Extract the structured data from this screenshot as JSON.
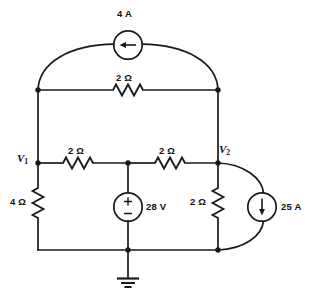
{
  "diagram": {
    "type": "electrical-schematic",
    "stroke_color": "#1a1a1a",
    "background_color": "#ffffff"
  },
  "labels": {
    "source_top": "4 A",
    "resistor_top": "2 Ω",
    "resistor_mid_left": "2 Ω",
    "resistor_mid_right": "2 Ω",
    "resistor_left_vertical": "4 Ω",
    "resistor_right_vertical": "2 Ω",
    "source_voltage": "28 V",
    "source_right": "25 A",
    "node_v1": "V",
    "node_v1_sub": "1",
    "node_v2": "V",
    "node_v2_sub": "2"
  },
  "components": [
    {
      "name": "current-source-4a",
      "kind": "current-source",
      "value": "4 A",
      "arrow_direction": "left",
      "cx": 128,
      "cy": 45
    },
    {
      "name": "resistor-top-2ohm",
      "kind": "resistor",
      "value": "2 Ω",
      "orientation": "horizontal"
    },
    {
      "name": "resistor-left-branch-2ohm",
      "kind": "resistor",
      "value": "2 Ω",
      "orientation": "horizontal"
    },
    {
      "name": "resistor-right-branch-2ohm",
      "kind": "resistor",
      "value": "2 Ω",
      "orientation": "horizontal"
    },
    {
      "name": "resistor-4ohm",
      "kind": "resistor",
      "value": "4 Ω",
      "orientation": "vertical"
    },
    {
      "name": "resistor-2ohm-vertical",
      "kind": "resistor",
      "value": "2 Ω",
      "orientation": "vertical"
    },
    {
      "name": "voltage-source-28v",
      "kind": "voltage-source",
      "value": "28 V",
      "polarity_top": "+",
      "polarity_bottom": "−",
      "cx": 128,
      "cy": 207
    },
    {
      "name": "current-source-25a",
      "kind": "current-source",
      "value": "25 A",
      "arrow_direction": "down",
      "cx": 262,
      "cy": 207
    },
    {
      "name": "ground-symbol",
      "kind": "ground",
      "x": 128,
      "y": 250
    }
  ],
  "nodes": [
    {
      "name": "node-top-left",
      "x": 38,
      "y": 90
    },
    {
      "name": "node-top-right",
      "x": 218,
      "y": 90
    },
    {
      "name": "node-v1",
      "x": 38,
      "y": 163,
      "label": "V1"
    },
    {
      "name": "node-middle",
      "x": 128,
      "y": 163
    },
    {
      "name": "node-v2",
      "x": 218,
      "y": 163,
      "label": "V2"
    },
    {
      "name": "node-ground",
      "x": 128,
      "y": 250
    },
    {
      "name": "node-bottom-right",
      "x": 218,
      "y": 250
    }
  ],
  "signs": {
    "plus": "+",
    "minus": "−"
  }
}
